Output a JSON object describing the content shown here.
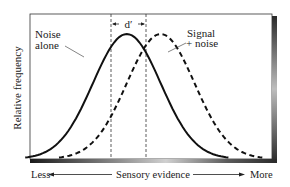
{
  "chart_data": {
    "type": "line",
    "title": "",
    "xlabel": "Sensory evidence",
    "ylabel": "Relative frequency",
    "x_axis": {
      "left_label": "Less",
      "right_label": "More",
      "arrows": true
    },
    "xlim": [
      0,
      10
    ],
    "ylim": [
      0,
      1
    ],
    "grid": false,
    "legend_position": "inline annotations",
    "series": [
      {
        "name": "Noise alone",
        "style": "solid",
        "mean": 4.0,
        "sd": 1.4,
        "peak": 1.0
      },
      {
        "name": "Signal + noise",
        "style": "dashed",
        "mean": 5.4,
        "sd": 1.4,
        "peak": 1.0
      }
    ],
    "annotations": [
      {
        "text": "d′",
        "type": "distance-between-means",
        "from": 4.0,
        "to": 5.4
      },
      {
        "text": "Noise alone",
        "points_to": "Noise alone"
      },
      {
        "text": "Signal + noise",
        "points_to": "Signal + noise"
      }
    ]
  },
  "labels": {
    "noise_line1": "Noise",
    "noise_line2": "alone",
    "signal_line1": "Signal",
    "signal_line2": "+ noise",
    "dprime": "d′",
    "ylabel": "Relative frequency",
    "x_less": "Less",
    "x_center": "Sensory evidence",
    "x_more": "More"
  },
  "colors": {
    "curve": "#111111",
    "frame": "#222222",
    "shadow_dark": "#3a3a3a",
    "shadow_light": "#d8d8d8"
  }
}
